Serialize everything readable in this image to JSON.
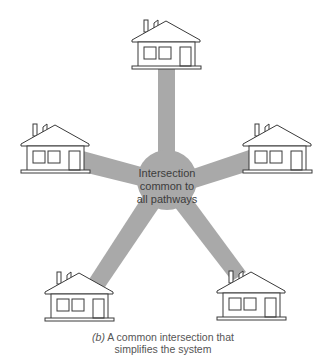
{
  "diagram": {
    "hub": {
      "lines": [
        "Intersection",
        "common to",
        "all pathways"
      ],
      "fill_color": "#a9a9a9"
    },
    "pathway_color": "#a9a9a9",
    "houses": [
      {
        "id": "top",
        "label": "house-top"
      },
      {
        "id": "left",
        "label": "house-left"
      },
      {
        "id": "right",
        "label": "house-right"
      },
      {
        "id": "bottom-left",
        "label": "house-bottom-left"
      },
      {
        "id": "bottom-right",
        "label": "house-bottom-right"
      }
    ]
  },
  "caption": {
    "label": "(b)",
    "line1_rest": " A common intersection that",
    "line2": "simplifies the system"
  }
}
